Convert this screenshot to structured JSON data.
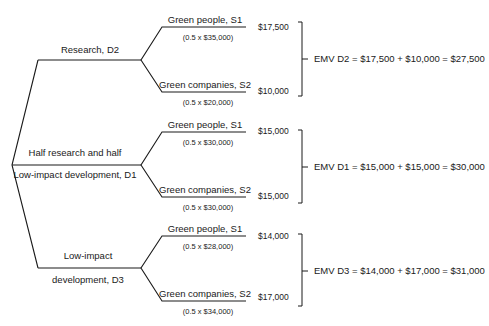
{
  "decisions": [
    {
      "id": "D2",
      "label_lines": [
        "Research, D2"
      ],
      "states": [
        {
          "label": "Green people, S1",
          "calc": "(0.5 x $35,000)",
          "value": "$17,500"
        },
        {
          "label": "Green companies, S2",
          "calc": "(0.5 x $20,000)",
          "value": "$10,000"
        }
      ],
      "emv": "EMV D2 = $17,500 + $10,000 = $27,500"
    },
    {
      "id": "D1",
      "label_lines": [
        "Half research and half",
        "Low-impact development, D1"
      ],
      "states": [
        {
          "label": "Green people, S1",
          "calc": "(0.5 x $30,000)",
          "value": "$15,000"
        },
        {
          "label": "Green companies, S2",
          "calc": "(0.5 x $30,000)",
          "value": "$15,000"
        }
      ],
      "emv": "EMV D1 = $15,000 + $15,000 = $30,000"
    },
    {
      "id": "D3",
      "label_lines": [
        "Low-impact",
        "development, D3"
      ],
      "states": [
        {
          "label": "Green people, S1",
          "calc": "(0.5 x $28,000)",
          "value": "$14,000"
        },
        {
          "label": "Green companies, S2",
          "calc": "(0.5 x $34,000)",
          "value": "$17,000"
        }
      ],
      "emv": "EMV D3 = $14,000 + $17,000 = $31,000"
    }
  ]
}
